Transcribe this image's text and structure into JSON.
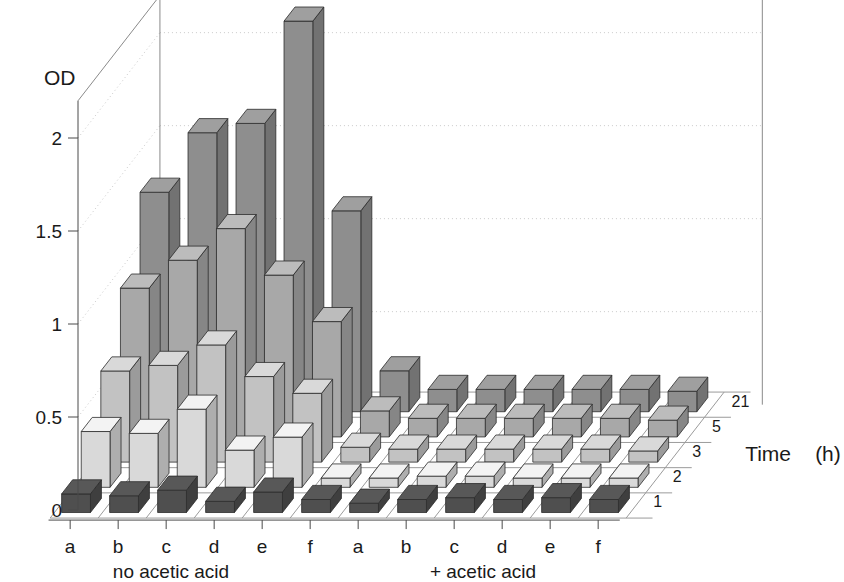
{
  "chart_data": {
    "type": "bar",
    "title": "",
    "ylabel": "OD",
    "xlabel": "",
    "zlabel": "Time   (h)",
    "ylim": [
      0,
      2.2
    ],
    "y_ticks": [
      "0",
      "0.5",
      "1",
      "1.5",
      "2"
    ],
    "y_tick_values": [
      0,
      0.5,
      1,
      1.5,
      2
    ],
    "grid": true,
    "legend": "none",
    "x_categories": [
      "a",
      "b",
      "c",
      "d",
      "e",
      "f",
      "a",
      "b",
      "c",
      "d",
      "e",
      "f"
    ],
    "x_group_labels": [
      "no acetic acid",
      "+ acetic acid"
    ],
    "z_categories": [
      "1",
      "2",
      "3",
      "5",
      "21"
    ],
    "z_axis_label": "Time   (h)",
    "series": [
      {
        "name": "1",
        "values": [
          0.1,
          0.09,
          0.12,
          0.06,
          0.11,
          0.07,
          0.05,
          0.07,
          0.08,
          0.07,
          0.08,
          0.07
        ]
      },
      {
        "name": "2",
        "values": [
          0.3,
          0.29,
          0.42,
          0.2,
          0.27,
          0.05,
          0.05,
          0.06,
          0.06,
          0.05,
          0.05,
          0.05
        ]
      },
      {
        "name": "3",
        "values": [
          0.49,
          0.52,
          0.63,
          0.46,
          0.37,
          0.08,
          0.07,
          0.07,
          0.07,
          0.07,
          0.07,
          0.06
        ]
      },
      {
        "name": "5",
        "values": [
          0.8,
          0.95,
          1.12,
          0.87,
          0.62,
          0.14,
          0.1,
          0.1,
          0.1,
          0.1,
          0.1,
          0.09
        ]
      },
      {
        "name": "21",
        "values": [
          1.18,
          1.5,
          1.55,
          2.1,
          1.08,
          0.22,
          0.12,
          0.12,
          0.12,
          0.12,
          0.12,
          0.11
        ]
      }
    ]
  },
  "axes": {
    "y_title": "OD",
    "z_title_time": "Time",
    "z_title_unit": "(h)"
  },
  "groups": {
    "left": "no acetic acid",
    "right": "+ acetic acid"
  },
  "colors": {
    "bar_row_1": "#4f4f4f",
    "bar_row_2": "#d9d9d9",
    "bar_row_3": "#c2c2c2",
    "bar_row_5": "#a8a8a8",
    "bar_row_21": "#8e8e8e",
    "frame": "#8a8a8a",
    "grid": "#c9c9c9",
    "text": "#1a1a1a"
  }
}
